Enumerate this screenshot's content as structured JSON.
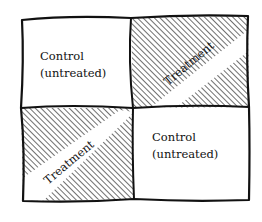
{
  "diagram": {
    "type": "2x2 experimental plot layout",
    "cells": [
      {
        "position": "top-left",
        "label_line1": "Control",
        "label_line2": "(untreated)",
        "hatched": false
      },
      {
        "position": "top-right",
        "label": "Treatment",
        "hatched": true
      },
      {
        "position": "bottom-left",
        "label": "Treatment",
        "hatched": true
      },
      {
        "position": "bottom-right",
        "label_line1": "Control",
        "label_line2": "(untreated)",
        "hatched": false
      }
    ],
    "colors": {
      "ink": "#111111",
      "background": "#ffffff"
    }
  }
}
